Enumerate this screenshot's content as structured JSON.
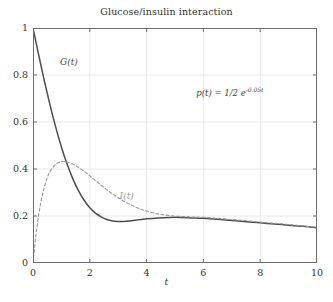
{
  "chart_data": {
    "type": "line",
    "title": "Glucose/insulin interaction",
    "xlabel": "t",
    "ylabel": "",
    "xlim": [
      0,
      10
    ],
    "ylim": [
      0,
      1
    ],
    "grid": true,
    "legend_position": "inline-annotations",
    "xticks": [
      "0",
      "2",
      "4",
      "6",
      "8",
      "10"
    ],
    "yticks": [
      "0",
      "0.2",
      "0.4",
      "0.6",
      "0.8",
      "1"
    ],
    "xtick_values": [
      0,
      2,
      4,
      6,
      8,
      10
    ],
    "ytick_values": [
      0,
      0.2,
      0.4,
      0.6,
      0.8,
      1
    ],
    "annotations": [
      {
        "name": "equation",
        "text": "p(t) = 1/2 e",
        "exponent": "-0.05t",
        "x": 5.75,
        "y": 0.755
      }
    ],
    "series": [
      {
        "name": "G(t)",
        "label": "G(t)",
        "label_x": 0.95,
        "label_y": 0.875,
        "style": "solid",
        "color": "#4d4d4d",
        "x": [
          0,
          0.2,
          0.4,
          0.6,
          0.8,
          1.0,
          1.2,
          1.4,
          1.6,
          1.8,
          2.0,
          2.2,
          2.4,
          2.6,
          2.8,
          3.0,
          3.2,
          3.4,
          3.6,
          3.8,
          4.0,
          4.4,
          4.8,
          5.2,
          5.6,
          6.0,
          6.5,
          7.0,
          7.5,
          8.0,
          8.5,
          9.0,
          9.5,
          10.0
        ],
        "y": [
          1.0,
          0.885,
          0.775,
          0.672,
          0.578,
          0.494,
          0.421,
          0.359,
          0.308,
          0.267,
          0.235,
          0.212,
          0.196,
          0.185,
          0.179,
          0.177,
          0.177,
          0.179,
          0.182,
          0.185,
          0.188,
          0.192,
          0.194,
          0.194,
          0.192,
          0.19,
          0.186,
          0.181,
          0.176,
          0.171,
          0.166,
          0.161,
          0.156,
          0.15
        ]
      },
      {
        "name": "I(t)",
        "label": "I(t)",
        "label_x": 3.05,
        "label_y": 0.305,
        "style": "dashed",
        "color": "#9a9a9a",
        "x": [
          0,
          0.1,
          0.2,
          0.3,
          0.4,
          0.5,
          0.6,
          0.8,
          1.0,
          1.1,
          1.2,
          1.4,
          1.6,
          1.8,
          2.0,
          2.2,
          2.4,
          2.6,
          2.8,
          3.0,
          3.2,
          3.4,
          3.6,
          3.8,
          4.0,
          4.4,
          4.8,
          5.2,
          5.6,
          6.0,
          6.5,
          7.0,
          7.5,
          8.0,
          8.5,
          9.0,
          9.5,
          10.0
        ],
        "y": [
          0.0,
          0.115,
          0.205,
          0.273,
          0.324,
          0.362,
          0.39,
          0.42,
          0.431,
          0.432,
          0.43,
          0.421,
          0.407,
          0.39,
          0.371,
          0.351,
          0.331,
          0.312,
          0.294,
          0.278,
          0.263,
          0.25,
          0.239,
          0.229,
          0.221,
          0.209,
          0.202,
          0.198,
          0.196,
          0.194,
          0.19,
          0.185,
          0.18,
          0.174,
          0.169,
          0.164,
          0.158,
          0.152
        ]
      }
    ]
  },
  "figure": {
    "background": "#ffffff",
    "axis_color": "#6e6e6e",
    "grid_color": "#e8e8e8",
    "text_color": "#333333"
  }
}
